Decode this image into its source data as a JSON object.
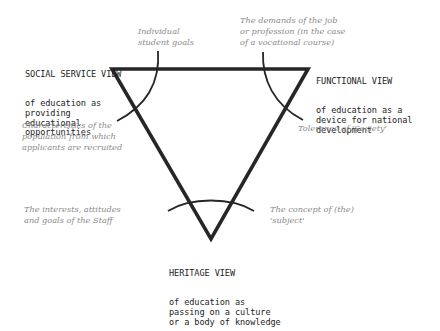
{
  "diagram": {
    "views": {
      "social_service": {
        "title": "SOCIAL SERVICE VIEW",
        "description": "of education as\nproviding\neducational\nopportunities"
      },
      "functional": {
        "title": "FUNCTIONAL VIEW",
        "description": "of education as a\ndevice for national\ndevelopment"
      },
      "heritage": {
        "title": "HERITAGE VIEW",
        "description": "of education as\npassing on a culture\nor a body of knowledge"
      }
    },
    "factors": {
      "individual_goals": "Individual\nstudent goals",
      "job_demands": "The demands of the job\nor profession (in the case\nof a vocational course)",
      "population": "Characteristics of the\npopulation from which\napplicants are recruited",
      "tolerance": "Tolerance of 'Society'",
      "staff": "The interests, attitudes\nand goals of the Staff",
      "subject": "The concept of (the)\n'subject'"
    },
    "colors": {
      "triangle": "#262626",
      "arc": "#262626",
      "view_text": "#1e1e1e",
      "factor_text": "#8a8a8a"
    }
  }
}
